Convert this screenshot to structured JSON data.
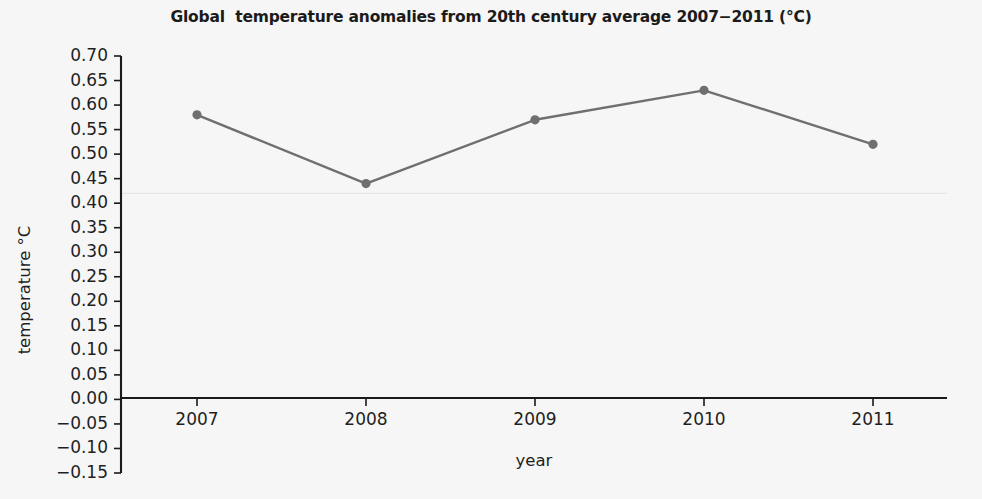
{
  "chart_data": {
    "type": "line",
    "title": "Global  temperature anomalies from 20th century average 2007−2011 (°C)",
    "xlabel": "year",
    "ylabel": "temperature °C",
    "categories": [
      "2007",
      "2008",
      "2009",
      "2010",
      "2011"
    ],
    "x": [
      2007,
      2008,
      2009,
      2010,
      2011
    ],
    "values": [
      0.58,
      0.44,
      0.57,
      0.63,
      0.52
    ],
    "series": [
      {
        "name": "Global temperature anomaly",
        "values": [
          0.58,
          0.44,
          0.57,
          0.63,
          0.52
        ]
      }
    ],
    "ylim": [
      -0.15,
      0.7
    ],
    "xlim": [
      2006.6,
      2011.7
    ],
    "ytick_labels": [
      "0.70",
      "0.65",
      "0.60",
      "0.55",
      "0.50",
      "0.45",
      "0.40",
      "0.35",
      "0.30",
      "0.25",
      "0.20",
      "0.15",
      "0.10",
      "0.05",
      "0.00",
      "−0.05",
      "−0.10",
      "−0.15"
    ],
    "ytick_values": [
      0.7,
      0.65,
      0.6,
      0.55,
      0.5,
      0.45,
      0.4,
      0.35,
      0.3,
      0.25,
      0.2,
      0.15,
      0.1,
      0.05,
      0.0,
      -0.05,
      -0.1,
      -0.15
    ],
    "xtick_labels": [
      "2007",
      "2008",
      "2009",
      "2010",
      "2011"
    ],
    "grid": true,
    "gridlines_y": [
      0.42
    ],
    "legend": null,
    "legend_position": "none",
    "line_color": "#6f6f6f",
    "marker_color": "#6f6f6f",
    "marker": "circle",
    "axis_color": "#1a1a1a",
    "background_color": "#f6f6f6",
    "text_color": "#1f1f1f",
    "grid_color": "#e3e3e8"
  }
}
